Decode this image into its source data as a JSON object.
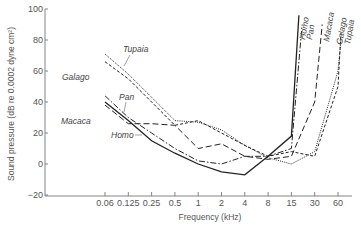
{
  "chart_data": {
    "type": "line",
    "title": "",
    "xlabel": "Frequency (kHz)",
    "ylabel": "Sound pressure (dB re 0.0002 dyne cm²)",
    "x_scale": "log",
    "x_ticks": [
      "0.06",
      "0.125",
      "0.25",
      "0.5",
      "1",
      "2",
      "4",
      "8",
      "15",
      "30",
      "60"
    ],
    "y_ticks": [
      "100",
      "80",
      "60",
      "40",
      "20",
      "0",
      "−20"
    ],
    "ylim": [
      -20,
      100
    ],
    "grid": false,
    "legend_position": "inline labels",
    "series": [
      {
        "name": "Homo",
        "style": "solid",
        "x": [
          0.06,
          0.125,
          0.25,
          0.5,
          1,
          2,
          4,
          8,
          15,
          20
        ],
        "values": [
          40,
          28,
          15,
          7,
          0,
          -5,
          -7,
          5,
          18,
          96
        ]
      },
      {
        "name": "Pan",
        "style": "dash-dot",
        "x": [
          0.06,
          0.125,
          0.25,
          0.5,
          1,
          2,
          4,
          8,
          15,
          22
        ],
        "values": [
          44,
          30,
          20,
          10,
          2,
          0,
          5,
          5,
          10,
          90
        ]
      },
      {
        "name": "Macaca",
        "style": "long-dash",
        "x": [
          0.06,
          0.125,
          0.25,
          0.5,
          1,
          2,
          4,
          8,
          15,
          30,
          40
        ],
        "values": [
          38,
          26,
          26,
          25,
          10,
          13,
          5,
          3,
          5,
          40,
          90
        ]
      },
      {
        "name": "Galago",
        "style": "short-dash",
        "x": [
          0.06,
          0.125,
          0.25,
          0.5,
          1,
          2,
          4,
          8,
          15,
          30,
          60,
          70
        ],
        "values": [
          66,
          55,
          40,
          25,
          28,
          20,
          12,
          5,
          8,
          5,
          50,
          85
        ]
      },
      {
        "name": "Tupaia",
        "style": "dotted",
        "x": [
          0.06,
          0.125,
          0.25,
          0.5,
          1,
          2,
          4,
          8,
          15,
          30,
          60,
          70
        ],
        "values": [
          71,
          58,
          43,
          28,
          27,
          22,
          12,
          4,
          0,
          8,
          60,
          80
        ]
      }
    ]
  },
  "labels": {
    "xlabel": "Frequency (kHz)",
    "ylabel": "Sound pressure (dB re 0.0002 dyne cm²)",
    "series": {
      "homo": "Homo",
      "pan": "Pan",
      "macaca": "Macaca",
      "galago": "Galago",
      "tupaia": "Tupaia"
    }
  }
}
